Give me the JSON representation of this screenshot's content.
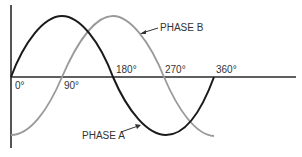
{
  "diagram": {
    "title": "",
    "type": "two-phase sine wave diagram",
    "axis_labels": {
      "deg0": "0°",
      "deg90": "90°",
      "deg180": "180°",
      "deg270": "270°",
      "deg360": "360°"
    },
    "phases": {
      "a": {
        "label": "PHASE A",
        "color": "#1a1a1a",
        "start_angle": 0
      },
      "b": {
        "label": "PHASE B",
        "color": "#9a9a9a",
        "start_angle": -90
      }
    },
    "axis_color": "#2a2a2a"
  }
}
